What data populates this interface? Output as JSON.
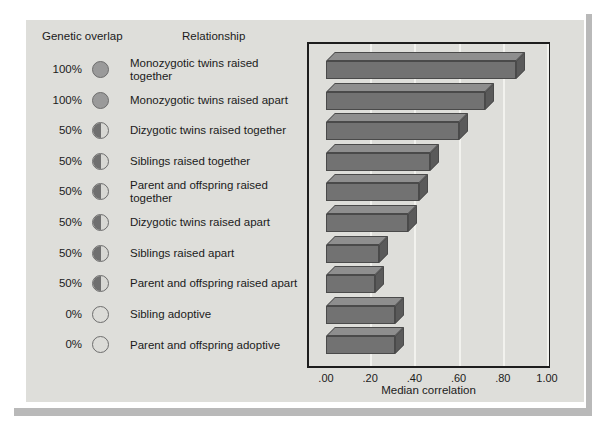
{
  "headers": {
    "overlap": "Genetic overlap",
    "relationship": "Relationship"
  },
  "axis": {
    "xlabel": "Median correlation",
    "ticks": [
      ".00",
      ".20",
      ".40",
      ".60",
      ".80",
      "1.00"
    ]
  },
  "rows": [
    {
      "pct": "100%",
      "fill": "full",
      "label": "Monozygotic twins raised together",
      "value": 0.86
    },
    {
      "pct": "100%",
      "fill": "full",
      "label": "Monozygotic twins raised apart",
      "value": 0.72
    },
    {
      "pct": "50%",
      "fill": "half",
      "label": "Dizygotic twins raised together",
      "value": 0.6
    },
    {
      "pct": "50%",
      "fill": "half",
      "label": "Siblings raised together",
      "value": 0.47
    },
    {
      "pct": "50%",
      "fill": "half",
      "label": "Parent and offspring raised together",
      "value": 0.42
    },
    {
      "pct": "50%",
      "fill": "half",
      "label": "Dizygotic twins raised apart",
      "value": 0.37
    },
    {
      "pct": "50%",
      "fill": "half",
      "label": "Siblings raised apart",
      "value": 0.24
    },
    {
      "pct": "50%",
      "fill": "half",
      "label": "Parent and offspring raised apart",
      "value": 0.22
    },
    {
      "pct": "0%",
      "fill": "empty",
      "label": "Sibling adoptive",
      "value": 0.31
    },
    {
      "pct": "0%",
      "fill": "empty",
      "label": "Parent and offspring adoptive",
      "value": 0.31
    }
  ],
  "colors": {
    "panel": "#dededa",
    "bar_front": "#727272",
    "bar_top": "#8e8e8e",
    "bar_side": "#5a5a5a",
    "axis": "#1d1d1d"
  },
  "chart_data": {
    "type": "bar",
    "orientation": "horizontal",
    "title": "",
    "xlabel": "Median correlation",
    "ylabel": "",
    "xlim": [
      0.0,
      1.0
    ],
    "xticks": [
      0.0,
      0.2,
      0.4,
      0.6,
      0.8,
      1.0
    ],
    "xticklabels": [
      ".00",
      ".20",
      ".40",
      ".60",
      ".80",
      "1.00"
    ],
    "grid": true,
    "legend": false,
    "categories": [
      "Monozygotic twins raised together",
      "Monozygotic twins raised apart",
      "Dizygotic twins raised together",
      "Siblings raised together",
      "Parent and offspring raised together",
      "Dizygotic twins raised apart",
      "Siblings raised apart",
      "Parent and offspring raised apart",
      "Sibling adoptive",
      "Parent and offspring adoptive"
    ],
    "values": [
      0.86,
      0.72,
      0.6,
      0.47,
      0.42,
      0.37,
      0.24,
      0.22,
      0.31,
      0.31
    ],
    "genetic_overlap": [
      "100%",
      "100%",
      "50%",
      "50%",
      "50%",
      "50%",
      "50%",
      "50%",
      "0%",
      "0%"
    ]
  }
}
